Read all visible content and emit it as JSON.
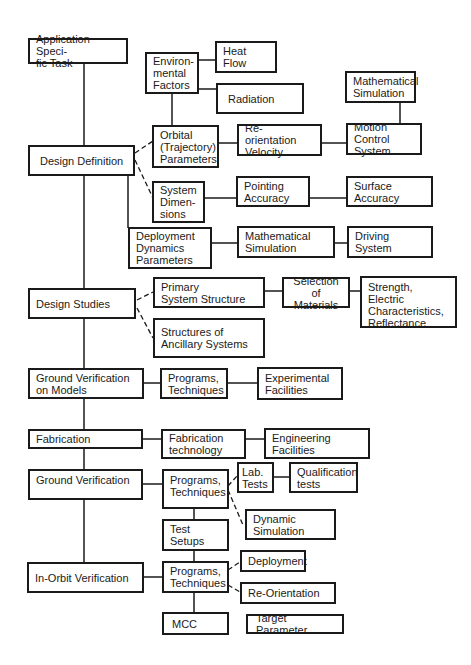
{
  "diagram": {
    "type": "flowchart",
    "main_steps": [
      {
        "id": "app-task",
        "label": "Application Speci-\nfic Task"
      },
      {
        "id": "design-definition",
        "label": "Design Definition"
      },
      {
        "id": "design-studies",
        "label": "Design Studies"
      },
      {
        "id": "ground-verification-models",
        "label": "Ground Verification\non Models"
      },
      {
        "id": "fabrication",
        "label": "Fabrication"
      },
      {
        "id": "ground-verification",
        "label": "Ground Verification"
      },
      {
        "id": "in-orbit-verification",
        "label": "In-Orbit Verification"
      }
    ],
    "nodes": {
      "environmental_factors": "Environ-\nmental\nFactors",
      "heat_flow": "Heat Flow",
      "radiation": "Radiation",
      "orbital_parameters": "Orbital\n(Trajectory)\nParameters",
      "reorientation_velocity": "Re-orientation\nVelocity",
      "math_simulation_1": "Mathematical\nSimulation",
      "motion_control_system": "Motion\nControl System",
      "system_dimensions": "System\nDimen-\nsions",
      "pointing_accuracy": "Pointing\nAccuracy",
      "surface_accuracy": "Surface\nAccuracy",
      "deployment_dynamics": "Deployment\nDynamics\nParameters",
      "math_simulation_2": "Mathematical\nSimulation",
      "driving_system": "Driving\nSystem",
      "primary_structure": "Primary\nSystem Structure",
      "selection_materials": "Selection\nof Materials",
      "strength": "Strength,\nElectric\nCharacteristics,\nReflectance",
      "ancillary_structures": "Structures of\nAncillary Systems",
      "programs_1": "Programs,\nTechniques",
      "experimental_facilities": "Experimental\nFacilities",
      "fabrication_technology": "Fabrication\ntechnology",
      "engineering_facilities": "Engineering\nFacilities",
      "programs_2": "Programs,\nTechniques",
      "lab_tests": "Lab.\nTests",
      "qualification_tests": "Qualification\ntests",
      "dynamic_simulation": "Dynamic\nSimulation",
      "test_setups": "Test\nSetups",
      "programs_3": "Programs,\nTechniques",
      "deployment": "Deployment",
      "re_orientation": "Re-Orientation",
      "mcc": "MCC",
      "target_parameter": "Target Parameter"
    },
    "edges": [
      {
        "from": "app-task",
        "to": "design-definition",
        "style": "solid"
      },
      {
        "from": "design-definition",
        "to": "design-studies",
        "style": "solid"
      },
      {
        "from": "design-studies",
        "to": "ground-verification-models",
        "style": "solid"
      },
      {
        "from": "ground-verification-models",
        "to": "fabrication",
        "style": "solid"
      },
      {
        "from": "fabrication",
        "to": "ground-verification",
        "style": "solid"
      },
      {
        "from": "ground-verification",
        "to": "in-orbit-verification",
        "style": "solid"
      },
      {
        "from": "design-definition",
        "to": "orbital_parameters",
        "style": "dashed"
      },
      {
        "from": "design-definition",
        "to": "system_dimensions",
        "style": "dashed"
      },
      {
        "from": "design-definition",
        "to": "deployment_dynamics",
        "style": "solid"
      },
      {
        "from": "environmental_factors",
        "to": "heat_flow",
        "style": "solid"
      },
      {
        "from": "environmental_factors",
        "to": "radiation",
        "style": "solid"
      },
      {
        "from": "environmental_factors",
        "to": "orbital_parameters",
        "style": "solid"
      },
      {
        "from": "orbital_parameters",
        "to": "reorientation_velocity",
        "style": "solid"
      },
      {
        "from": "reorientation_velocity",
        "to": "motion_control_system",
        "style": "solid"
      },
      {
        "from": "math_simulation_1",
        "to": "motion_control_system",
        "style": "solid"
      },
      {
        "from": "system_dimensions",
        "to": "pointing_accuracy",
        "style": "solid"
      },
      {
        "from": "pointing_accuracy",
        "to": "surface_accuracy",
        "style": "solid"
      },
      {
        "from": "deployment_dynamics",
        "to": "math_simulation_2",
        "style": "solid"
      },
      {
        "from": "math_simulation_2",
        "to": "driving_system",
        "style": "solid"
      },
      {
        "from": "design-studies",
        "to": "primary_structure",
        "style": "dashed"
      },
      {
        "from": "design-studies",
        "to": "ancillary_structures",
        "style": "dashed"
      },
      {
        "from": "primary_structure",
        "to": "selection_materials",
        "style": "solid"
      },
      {
        "from": "selection_materials",
        "to": "strength",
        "style": "solid"
      },
      {
        "from": "ground-verification-models",
        "to": "programs_1",
        "style": "solid"
      },
      {
        "from": "programs_1",
        "to": "experimental_facilities",
        "style": "solid"
      },
      {
        "from": "fabrication",
        "to": "fabrication_technology",
        "style": "solid"
      },
      {
        "from": "fabrication_technology",
        "to": "engineering_facilities",
        "style": "solid"
      },
      {
        "from": "ground-verification",
        "to": "programs_2",
        "style": "solid"
      },
      {
        "from": "programs_2",
        "to": "lab_tests",
        "style": "dashed"
      },
      {
        "from": "programs_2",
        "to": "dynamic_simulation",
        "style": "dashed"
      },
      {
        "from": "lab_tests",
        "to": "qualification_tests",
        "style": "solid"
      },
      {
        "from": "programs_2",
        "to": "test_setups",
        "style": "solid"
      },
      {
        "from": "test_setups",
        "to": "programs_3",
        "style": "solid"
      },
      {
        "from": "in-orbit-verification",
        "to": "programs_3",
        "style": "solid"
      },
      {
        "from": "programs_3",
        "to": "deployment",
        "style": "dashed"
      },
      {
        "from": "programs_3",
        "to": "re_orientation",
        "style": "dashed"
      },
      {
        "from": "programs_3",
        "to": "mcc",
        "style": "solid"
      }
    ]
  }
}
